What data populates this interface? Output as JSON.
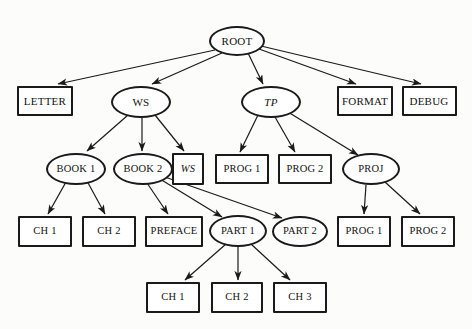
{
  "diagram": {
    "canvas": {
      "width": 472,
      "height": 329
    },
    "style": {
      "background_color": "#fcfcfa",
      "node_fill": "#ffffff",
      "node_stroke": "#1a1a1a",
      "text_color": "#111111",
      "edge_color": "#1a1a1a"
    },
    "nodes": [
      {
        "id": "root",
        "label": "ROOT",
        "shape": "ellipse",
        "italic": false,
        "cx": 237,
        "cy": 41,
        "w": 56,
        "h": 30,
        "font_size": 11
      },
      {
        "id": "letter",
        "label": "LETTER",
        "shape": "box",
        "italic": false,
        "cx": 45,
        "cy": 101,
        "w": 56,
        "h": 30,
        "font_size": 11
      },
      {
        "id": "ws1",
        "label": "WS",
        "shape": "ellipse",
        "italic": false,
        "cx": 141,
        "cy": 102,
        "w": 60,
        "h": 32,
        "font_size": 11
      },
      {
        "id": "tp",
        "label": "TP",
        "shape": "ellipse",
        "italic": true,
        "cx": 271,
        "cy": 102,
        "w": 60,
        "h": 32,
        "font_size": 11
      },
      {
        "id": "format",
        "label": "FORMAT",
        "shape": "box",
        "italic": false,
        "cx": 365,
        "cy": 101,
        "w": 56,
        "h": 30,
        "font_size": 11
      },
      {
        "id": "debug",
        "label": "DEBUG",
        "shape": "box",
        "italic": false,
        "cx": 429,
        "cy": 101,
        "w": 55,
        "h": 30,
        "font_size": 11
      },
      {
        "id": "book1",
        "label": "BOOK 1",
        "shape": "ellipse",
        "italic": false,
        "cx": 76,
        "cy": 169,
        "w": 60,
        "h": 32,
        "font_size": 10.5
      },
      {
        "id": "book2",
        "label": "BOOK 2",
        "shape": "ellipse",
        "italic": false,
        "cx": 143,
        "cy": 169,
        "w": 60,
        "h": 32,
        "font_size": 10.5
      },
      {
        "id": "ws2",
        "label": "WS",
        "shape": "box",
        "italic": true,
        "cx": 188,
        "cy": 169,
        "w": 32,
        "h": 32,
        "font_size": 10.5
      },
      {
        "id": "prog1a",
        "label": "PROG 1",
        "shape": "box",
        "italic": false,
        "cx": 242,
        "cy": 169,
        "w": 54,
        "h": 30,
        "font_size": 10.5
      },
      {
        "id": "prog2a",
        "label": "PROG 2",
        "shape": "box",
        "italic": false,
        "cx": 305,
        "cy": 169,
        "w": 54,
        "h": 30,
        "font_size": 10.5
      },
      {
        "id": "proj",
        "label": "PROJ",
        "shape": "ellipse",
        "italic": false,
        "cx": 371,
        "cy": 169,
        "w": 58,
        "h": 32,
        "font_size": 10.5
      },
      {
        "id": "ch1a",
        "label": "CH 1",
        "shape": "box",
        "italic": false,
        "cx": 45,
        "cy": 231,
        "w": 54,
        "h": 31,
        "font_size": 10.5
      },
      {
        "id": "ch2a",
        "label": "CH 2",
        "shape": "box",
        "italic": false,
        "cx": 109,
        "cy": 231,
        "w": 54,
        "h": 31,
        "font_size": 10.5
      },
      {
        "id": "preface",
        "label": "PREFACE",
        "shape": "box",
        "italic": false,
        "cx": 174,
        "cy": 231,
        "w": 58,
        "h": 31,
        "font_size": 10.5
      },
      {
        "id": "part1",
        "label": "PART 1",
        "shape": "ellipse",
        "italic": false,
        "cx": 238,
        "cy": 231,
        "w": 58,
        "h": 32,
        "font_size": 10.5
      },
      {
        "id": "part2",
        "label": "PART 2",
        "shape": "ellipse",
        "italic": false,
        "cx": 300,
        "cy": 231,
        "w": 56,
        "h": 31,
        "font_size": 10.5
      },
      {
        "id": "prog1b",
        "label": "PROG 1",
        "shape": "box",
        "italic": false,
        "cx": 364,
        "cy": 231,
        "w": 54,
        "h": 31,
        "font_size": 10.5
      },
      {
        "id": "prog2b",
        "label": "PROG 2",
        "shape": "box",
        "italic": false,
        "cx": 428,
        "cy": 231,
        "w": 54,
        "h": 31,
        "font_size": 10.5
      },
      {
        "id": "ch1b",
        "label": "CH 1",
        "shape": "box",
        "italic": false,
        "cx": 173,
        "cy": 297,
        "w": 54,
        "h": 31,
        "font_size": 10.5
      },
      {
        "id": "ch2b",
        "label": "CH 2",
        "shape": "box",
        "italic": false,
        "cx": 237,
        "cy": 297,
        "w": 52,
        "h": 31,
        "font_size": 10.5
      },
      {
        "id": "ch3b",
        "label": "CH 3",
        "shape": "box",
        "italic": false,
        "cx": 300,
        "cy": 297,
        "w": 54,
        "h": 31,
        "font_size": 10.5
      }
    ],
    "edges": [
      {
        "from": "root",
        "to": "letter",
        "x1": 215,
        "y1": 50,
        "x2": 58,
        "y2": 84
      },
      {
        "from": "root",
        "to": "ws1",
        "x1": 222,
        "y1": 53,
        "x2": 152,
        "y2": 84
      },
      {
        "from": "root",
        "to": "tp",
        "x1": 248,
        "y1": 53,
        "x2": 263,
        "y2": 84
      },
      {
        "from": "root",
        "to": "format",
        "x1": 259,
        "y1": 49,
        "x2": 356,
        "y2": 84
      },
      {
        "from": "root",
        "to": "debug",
        "x1": 261,
        "y1": 46,
        "x2": 421,
        "y2": 84
      },
      {
        "from": "ws1",
        "to": "book1",
        "x1": 128,
        "y1": 115,
        "x2": 87,
        "y2": 151
      },
      {
        "from": "ws1",
        "to": "book2",
        "x1": 142,
        "y1": 118,
        "x2": 142,
        "y2": 151
      },
      {
        "from": "ws1",
        "to": "ws2",
        "x1": 155,
        "y1": 115,
        "x2": 184,
        "y2": 151
      },
      {
        "from": "tp",
        "to": "prog1a",
        "x1": 258,
        "y1": 115,
        "x2": 240,
        "y2": 152
      },
      {
        "from": "tp",
        "to": "prog2a",
        "x1": 275,
        "y1": 117,
        "x2": 295,
        "y2": 152
      },
      {
        "from": "tp",
        "to": "proj",
        "x1": 288,
        "y1": 112,
        "x2": 358,
        "y2": 155
      },
      {
        "from": "book1",
        "to": "ch1a",
        "x1": 66,
        "y1": 182,
        "x2": 48,
        "y2": 214
      },
      {
        "from": "book1",
        "to": "ch2a",
        "x1": 87,
        "y1": 181,
        "x2": 105,
        "y2": 214
      },
      {
        "from": "book2",
        "to": "preface",
        "x1": 147,
        "y1": 183,
        "x2": 168,
        "y2": 214
      },
      {
        "from": "book2",
        "to": "part1",
        "x1": 160,
        "y1": 179,
        "x2": 222,
        "y2": 217
      },
      {
        "from": "book2",
        "to": "part2",
        "x1": 162,
        "y1": 176,
        "x2": 282,
        "y2": 218
      },
      {
        "from": "part1",
        "to": "ch1b",
        "x1": 226,
        "y1": 244,
        "x2": 185,
        "y2": 280
      },
      {
        "from": "part1",
        "to": "ch2b",
        "x1": 238,
        "y1": 247,
        "x2": 238,
        "y2": 280
      },
      {
        "from": "part1",
        "to": "ch3b",
        "x1": 251,
        "y1": 244,
        "x2": 290,
        "y2": 280
      },
      {
        "from": "proj",
        "to": "prog1b",
        "x1": 366,
        "y1": 185,
        "x2": 364,
        "y2": 214
      },
      {
        "from": "proj",
        "to": "prog2b",
        "x1": 385,
        "y1": 182,
        "x2": 420,
        "y2": 214
      }
    ]
  }
}
